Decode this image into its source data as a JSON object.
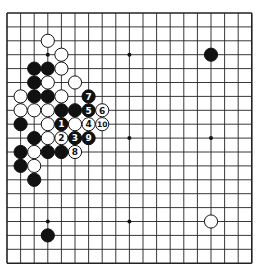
{
  "board": {
    "size": 19,
    "origin_x": 7,
    "origin_y": 13,
    "step_x": 13.6,
    "step_y": 13.9,
    "stone_radius": 6.6,
    "line_color": "#222222",
    "background": "#ffffff",
    "hoshi": [
      [
        3,
        3
      ],
      [
        9,
        3
      ],
      [
        15,
        3
      ],
      [
        3,
        9
      ],
      [
        9,
        9
      ],
      [
        15,
        9
      ],
      [
        3,
        15
      ],
      [
        9,
        15
      ],
      [
        15,
        15
      ]
    ]
  },
  "stones": [
    {
      "color": "white",
      "col": 3,
      "row": 2
    },
    {
      "color": "white",
      "col": 4,
      "row": 3
    },
    {
      "color": "black",
      "col": 2,
      "row": 4
    },
    {
      "color": "black",
      "col": 3,
      "row": 4
    },
    {
      "color": "white",
      "col": 4,
      "row": 4
    },
    {
      "color": "black",
      "col": 2,
      "row": 5
    },
    {
      "color": "white",
      "col": 3,
      "row": 5
    },
    {
      "color": "white",
      "col": 5,
      "row": 5
    },
    {
      "color": "white",
      "col": 1,
      "row": 6
    },
    {
      "color": "black",
      "col": 2,
      "row": 6
    },
    {
      "color": "black",
      "col": 3,
      "row": 6
    },
    {
      "color": "white",
      "col": 4,
      "row": 6
    },
    {
      "color": "black",
      "col": 6,
      "row": 6,
      "label": "7"
    },
    {
      "color": "white",
      "col": 1,
      "row": 7
    },
    {
      "color": "white",
      "col": 2,
      "row": 7
    },
    {
      "color": "white",
      "col": 3,
      "row": 7
    },
    {
      "color": "black",
      "col": 4,
      "row": 7
    },
    {
      "color": "black",
      "col": 5,
      "row": 7
    },
    {
      "color": "black",
      "col": 6,
      "row": 7,
      "label": "5"
    },
    {
      "color": "white",
      "col": 7,
      "row": 7,
      "label": "6"
    },
    {
      "color": "black",
      "col": 1,
      "row": 8
    },
    {
      "color": "white",
      "col": 3,
      "row": 8
    },
    {
      "color": "black",
      "col": 4,
      "row": 8,
      "label": "1"
    },
    {
      "color": "white",
      "col": 5,
      "row": 8
    },
    {
      "color": "white",
      "col": 6,
      "row": 8,
      "label": "4"
    },
    {
      "color": "white",
      "col": 7,
      "row": 8,
      "label": "10"
    },
    {
      "color": "black",
      "col": 2,
      "row": 9
    },
    {
      "color": "white",
      "col": 3,
      "row": 9
    },
    {
      "color": "white",
      "col": 4,
      "row": 9,
      "label": "2"
    },
    {
      "color": "black",
      "col": 5,
      "row": 9,
      "label": "3"
    },
    {
      "color": "black",
      "col": 6,
      "row": 9,
      "label": "9"
    },
    {
      "color": "black",
      "col": 1,
      "row": 10
    },
    {
      "color": "white",
      "col": 2,
      "row": 10
    },
    {
      "color": "black",
      "col": 3,
      "row": 10
    },
    {
      "color": "black",
      "col": 4,
      "row": 10
    },
    {
      "color": "white",
      "col": 5,
      "row": 10,
      "label": "8"
    },
    {
      "color": "black",
      "col": 1,
      "row": 11
    },
    {
      "color": "white",
      "col": 2,
      "row": 11
    },
    {
      "color": "black",
      "col": 2,
      "row": 12
    },
    {
      "color": "black",
      "col": 15,
      "row": 3
    },
    {
      "color": "white",
      "col": 15,
      "row": 15
    },
    {
      "color": "black",
      "col": 3,
      "row": 16
    }
  ]
}
